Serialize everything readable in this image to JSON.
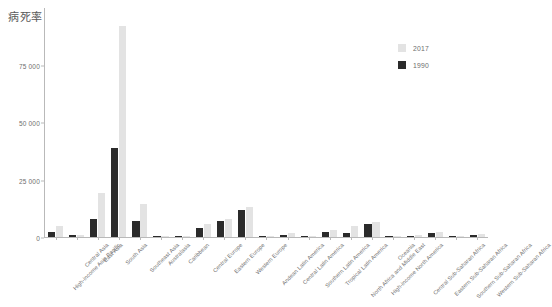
{
  "chart_data": {
    "type": "bar",
    "title": "病死率",
    "xlabel": "",
    "ylabel": "",
    "ylim": [
      0,
      100000
    ],
    "yticks": [
      0,
      25000,
      50000,
      75000
    ],
    "ytick_labels": [
      "0",
      "25 000",
      "50 000",
      "75 000"
    ],
    "grid": false,
    "legend_position": "top-right",
    "categories": [
      "High-income Asia Pacific",
      "Central Asia",
      "East Asia",
      "South Asia",
      "Southeast Asia",
      "Australasia",
      "Caribbean",
      "Central Europe",
      "Eastern Europe",
      "Western Europe",
      "Andean Latin America",
      "Central Latin America",
      "Southern Latin America",
      "Tropical Latin America",
      "North Africa and Middle East",
      "High-income North America",
      "Oceania",
      "Central Sub-Saharan Africa",
      "Eastern Sub-Saharan Africa",
      "Southern Sub-Saharan Africa",
      "Western Sub-Saharan Africa"
    ],
    "series": [
      {
        "name": "1990",
        "color": "#2b2b2b",
        "values": [
          2100,
          900,
          8000,
          38800,
          6900,
          300,
          500,
          4100,
          6900,
          12000,
          250,
          800,
          400,
          2000,
          1600,
          5700,
          150,
          400,
          1600,
          500,
          700
        ]
      },
      {
        "name": "2017",
        "color": "#e3e3e3",
        "values": [
          4800,
          700,
          19400,
          92000,
          14300,
          350,
          600,
          5500,
          8000,
          13000,
          300,
          1700,
          500,
          3000,
          4700,
          6500,
          200,
          900,
          2300,
          600,
          1400
        ]
      }
    ]
  },
  "legend": {
    "items": [
      {
        "label": "2017",
        "color": "#e3e3e3"
      },
      {
        "label": "1990",
        "color": "#2b2b2b"
      }
    ]
  }
}
